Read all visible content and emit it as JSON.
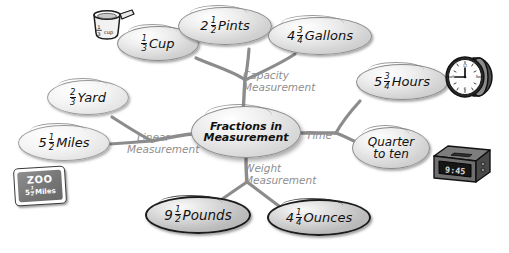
{
  "diagram": {
    "type": "mind-map",
    "center": {
      "line1": "Fractions in",
      "line2": "Measurement"
    },
    "branches": [
      {
        "id": "capacity",
        "label_line1": "Capacity",
        "label_line2": "Measurement",
        "leaves": [
          "one-third-cup",
          "two-and-half-pints",
          "four-and-three-quarter-gallons"
        ]
      },
      {
        "id": "linear",
        "label_line1": "Linear",
        "label_line2": "Measurement",
        "leaves": [
          "two-thirds-yard",
          "five-and-half-miles"
        ]
      },
      {
        "id": "time",
        "label_line1": "Time",
        "label_line2": "",
        "leaves": [
          "five-and-three-quarter-hours",
          "quarter-to-ten"
        ]
      },
      {
        "id": "weight",
        "label_line1": "Weight",
        "label_line2": "Measurement",
        "leaves": [
          "nine-and-half-pounds",
          "four-and-quarter-ounces"
        ]
      }
    ],
    "nodes": {
      "one_third_cup": {
        "whole": "",
        "num": "1",
        "den": "3",
        "unit": "Cup"
      },
      "two_half_pints": {
        "whole": "2",
        "num": "1",
        "den": "2",
        "unit": "Pints"
      },
      "four_three_quarter_gallons": {
        "whole": "4",
        "num": "3",
        "den": "4",
        "unit": "Gallons"
      },
      "two_thirds_yard": {
        "whole": "",
        "num": "2",
        "den": "3",
        "unit": "Yard"
      },
      "five_half_miles": {
        "whole": "5",
        "num": "1",
        "den": "2",
        "unit": "Miles"
      },
      "five_three_quarter_hours": {
        "whole": "5",
        "num": "3",
        "den": "4",
        "unit": "Hours"
      },
      "quarter_to_ten": {
        "line1": "Quarter",
        "line2": "to ten"
      },
      "nine_half_pounds": {
        "whole": "9",
        "num": "1",
        "den": "2",
        "unit": "Pounds"
      },
      "four_quarter_ounces": {
        "whole": "4",
        "num": "1",
        "den": "4",
        "unit": "Ounces"
      }
    },
    "illustrations": {
      "measuring_cup": {
        "name": "measuring-cup",
        "num": "1",
        "den": "3",
        "unit": "cup"
      },
      "analog_clock": {
        "name": "analog-clock",
        "time": "9:45"
      },
      "digital_clock": {
        "name": "digital-clock",
        "display": "9:45"
      },
      "zoo_sign": {
        "name": "zoo-road-sign",
        "word": "ZOO",
        "whole": "5",
        "num": "1",
        "den": "2",
        "unit": "Miles"
      }
    },
    "colors": {
      "background": "#ffffff",
      "edge": "#8c8c8c",
      "branch_label_text": "#8e8e8e",
      "node_text": "#111111",
      "node_light_fill": "#eeeeee",
      "node_mid_fill": "#d8d8d8",
      "node_dark_fill": "#c0c0c0"
    }
  }
}
